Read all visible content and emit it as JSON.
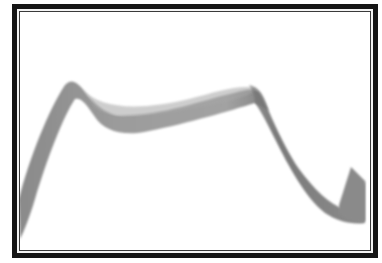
{
  "image": {
    "subject": "grayscale ribbon",
    "colors": {
      "frame": "#151515",
      "frame_gap": "#f4f4f4",
      "frame_inner_line": "#3a3a3a",
      "background": "#ffffff",
      "ribbon_light": "#a8a8a8",
      "ribbon_mid": "#8e8e8e",
      "ribbon_dark": "#6e6e6e"
    }
  }
}
